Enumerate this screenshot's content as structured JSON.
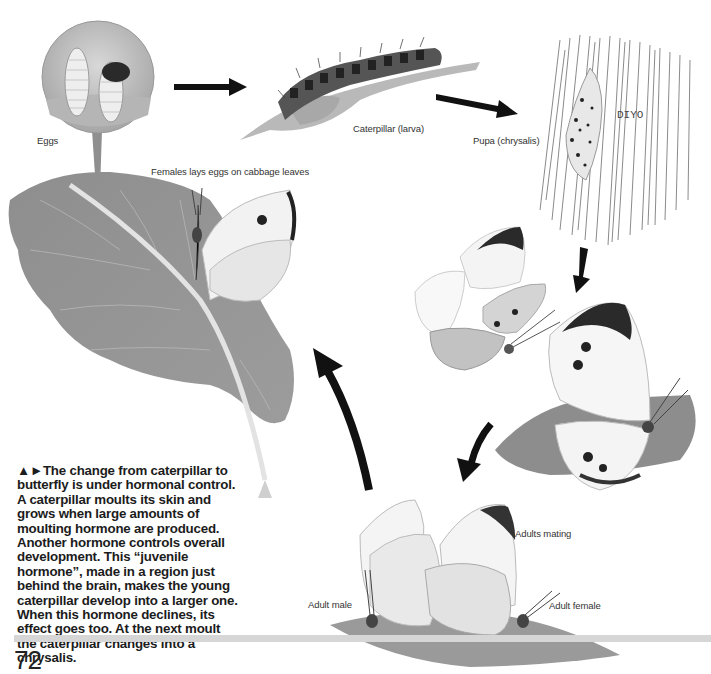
{
  "page": {
    "number": "72"
  },
  "labels": {
    "eggs": "Eggs",
    "caterpillar": "Caterpillar (larva)",
    "pupa": "Pupa (chrysalis)",
    "female_lays": "Females lays eggs on cabbage leaves",
    "adults_mating": "Adults mating",
    "adult_male": "Adult male",
    "adult_female": "Adult female",
    "pupa_inscription": "DIYO"
  },
  "caption": {
    "markers": "▲►",
    "text": "The change from caterpillar to butterfly is under hormonal control. A caterpillar moults its skin and grows when large amounts of moulting hormone are produced. Another hormone controls overall development. This “juvenile hormone”, made in a region just behind the brain, makes the young caterpillar develop into a larger one. When this hormone declines, its effect goes too. At the next moult the caterpillar changes into a chrysalis."
  },
  "illustrations": [
    {
      "id": "eggs",
      "description": "magnified circle showing two ribbed eggs, one hatching"
    },
    {
      "id": "caterpillar",
      "description": "hairy spotted caterpillar on a leaf"
    },
    {
      "id": "pupa",
      "description": "spotted chrysalis on striated wood"
    },
    {
      "id": "cabbage-leaf",
      "description": "large cabbage leaf with female butterfly laying eggs"
    },
    {
      "id": "emerging-butterfly",
      "description": "butterfly with wings folded, newly emerged"
    },
    {
      "id": "spread-butterfly",
      "description": "butterfly with wings spread on a leaf"
    },
    {
      "id": "mating-pair",
      "description": "male and female butterflies mating on a leaf"
    }
  ],
  "colors": {
    "arrow": "#111111",
    "rule": "#d6d6d6",
    "text": "#1c1c1c",
    "leaf": "#8a8a8a"
  }
}
